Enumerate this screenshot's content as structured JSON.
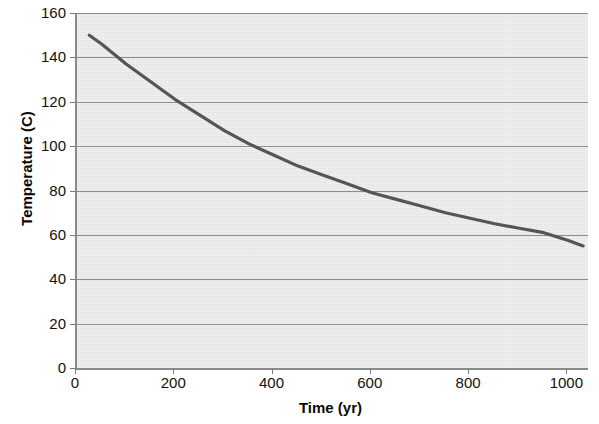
{
  "chart_data": {
    "type": "line",
    "title": "",
    "xlabel": "Time (yr)",
    "ylabel": "Temperature (C)",
    "xlim": [
      0,
      1040
    ],
    "ylim": [
      0,
      160
    ],
    "x_ticks": [
      0,
      200,
      400,
      600,
      800,
      1000
    ],
    "y_ticks": [
      0,
      20,
      40,
      60,
      80,
      100,
      120,
      140,
      160
    ],
    "grid": "horizontal",
    "legend": "none",
    "plot_background": "#e9e9e9",
    "line_color": "#555555",
    "series": [
      {
        "name": "Temperature",
        "x": [
          25,
          50,
          100,
          150,
          200,
          250,
          300,
          350,
          400,
          450,
          500,
          550,
          600,
          650,
          700,
          750,
          800,
          850,
          900,
          950,
          1000,
          1030
        ],
        "y": [
          150,
          146,
          137,
          129,
          121,
          114,
          107,
          101,
          96,
          91,
          87,
          83,
          79,
          76,
          73,
          70,
          67.5,
          65,
          63,
          61,
          57.5,
          55
        ]
      }
    ]
  }
}
